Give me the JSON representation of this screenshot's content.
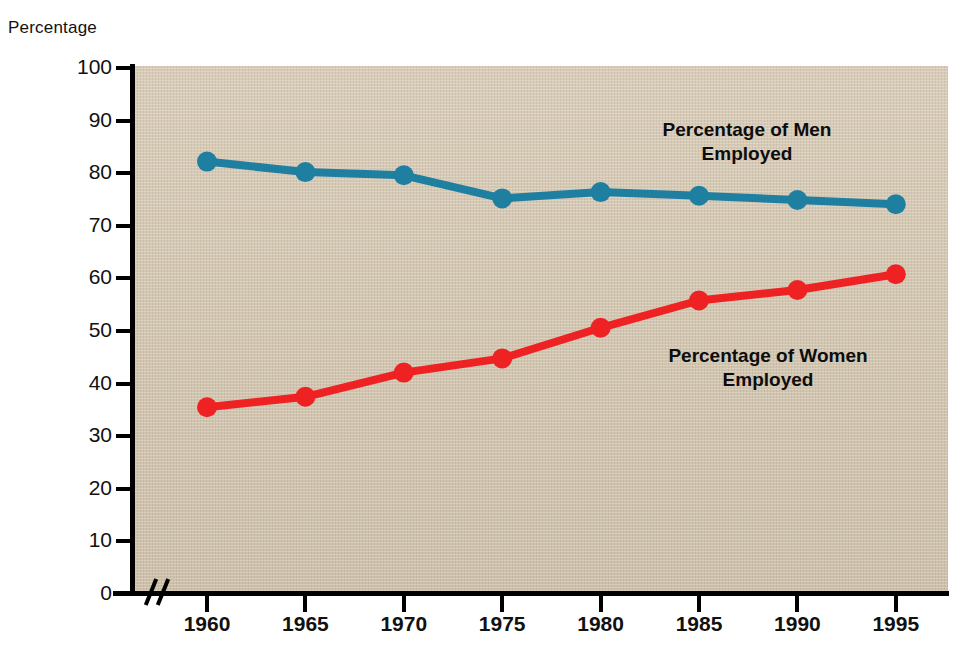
{
  "chart_data": {
    "type": "line",
    "title": "",
    "xlabel": "",
    "ylabel": "Percentage",
    "x": [
      1960,
      1965,
      1970,
      1975,
      1980,
      1985,
      1990,
      1995
    ],
    "categories": [
      "1960",
      "1965",
      "1970",
      "1975",
      "1980",
      "1985",
      "1990",
      "1995"
    ],
    "series": [
      {
        "name": "Percentage of Men Employed",
        "label_line1": "Percentage of Men",
        "label_line2": "Employed",
        "color": "#1f7fa0",
        "values": [
          82.2,
          80.2,
          79.6,
          75.2,
          76.4,
          75.7,
          74.9,
          74.1
        ]
      },
      {
        "name": "Percentage of Women Employed",
        "label_line1": "Percentage of Women",
        "label_line2": "Employed",
        "color": "#ee2222",
        "values": [
          35.5,
          37.5,
          42.1,
          44.8,
          50.6,
          55.8,
          57.8,
          60.8
        ]
      }
    ],
    "ylim": [
      0,
      100
    ],
    "ytick_step": 10,
    "yticks": [
      "100",
      "90",
      "80",
      "70",
      "60",
      "50",
      "40",
      "30",
      "20",
      "10",
      "0"
    ],
    "xlim": [
      1960,
      1995
    ],
    "grid": false,
    "legend_position": "inline-annotation",
    "axis_break_x": true,
    "plot_background_color": "#d3c7b2"
  },
  "axis": {
    "y_axis_title": "Percentage"
  },
  "icons": {
    "axis_break": "axis-break-icon"
  }
}
